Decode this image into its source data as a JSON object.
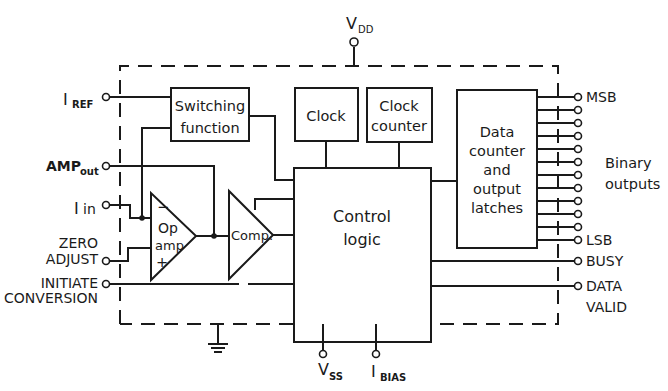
{
  "diagram": {
    "type": "block-diagram",
    "title": "",
    "supply": {
      "vdd": {
        "main": "V",
        "sub": "DD"
      },
      "vss": {
        "main": "V",
        "sub": "SS"
      },
      "ibias": {
        "main": "I",
        "sub": "BIAS"
      },
      "ground": "ground"
    },
    "inputs": {
      "iref": {
        "main": "I",
        "sub": "REF"
      },
      "ampout": {
        "main": "AMP",
        "sub": "out"
      },
      "iin": {
        "main": "I",
        "sub": "in"
      },
      "zero_adjust": [
        "ZERO",
        "ADJUST"
      ],
      "initiate_conversion": [
        "INITIATE",
        "CONVERSION"
      ]
    },
    "blocks": {
      "switching_function": [
        "Switching",
        "function"
      ],
      "clock": [
        "Clock"
      ],
      "clock_counter": [
        "Clock",
        "counter"
      ],
      "data_counter": [
        "Data",
        "counter",
        "and",
        "output",
        "latches"
      ],
      "control_logic": [
        "Control",
        "logic"
      ],
      "op_amp": {
        "minus": "−",
        "line1": "Op",
        "line2": "amp",
        "plus": "+"
      },
      "comparator": "Comp."
    },
    "outputs": {
      "msb": "MSB",
      "lsb": "LSB",
      "binary_outputs": [
        "Binary",
        "outputs"
      ],
      "binary_output_count": 12,
      "busy": "BUSY",
      "data_valid": [
        "DATA",
        "VALID"
      ]
    }
  }
}
